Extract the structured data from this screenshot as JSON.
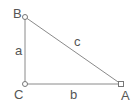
{
  "diagram": {
    "type": "right-triangle",
    "vertices": [
      {
        "name": "B",
        "x": 25,
        "y": 17,
        "label_x": 13,
        "label_y": 18
      },
      {
        "name": "C",
        "x": 25,
        "y": 84,
        "label_x": 14,
        "label_y": 99
      },
      {
        "name": "A",
        "x": 121,
        "y": 84,
        "label_x": 121,
        "label_y": 100
      }
    ],
    "sides": [
      {
        "name": "a",
        "from": "B",
        "to": "C",
        "label_x": 15,
        "label_y": 55
      },
      {
        "name": "b",
        "from": "C",
        "to": "A",
        "label_x": 70,
        "label_y": 99
      },
      {
        "name": "c",
        "from": "B",
        "to": "A",
        "label_x": 74,
        "label_y": 46
      }
    ],
    "colors": {
      "edge": "#8a8a8a",
      "label": "#555555",
      "vertex_fill": "#ffffff"
    }
  }
}
